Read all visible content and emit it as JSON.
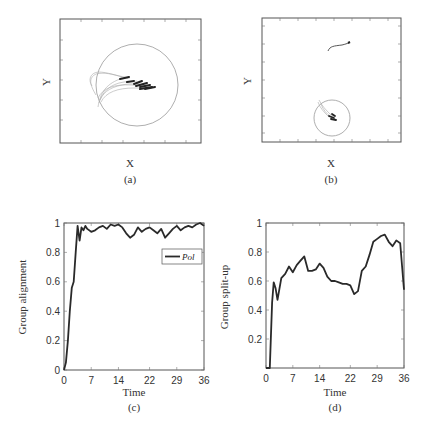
{
  "chart_data": [
    {
      "id": "a",
      "type": "scatter",
      "title": "",
      "caption": "(a)",
      "xlabel": "X",
      "ylabel": "Y",
      "description": "Trajectories of agents converging rightward inside a large circular region",
      "grid": false
    },
    {
      "id": "b",
      "type": "scatter",
      "title": "",
      "caption": "(b)",
      "xlabel": "X",
      "ylabel": "Y",
      "description": "Split group: one short trajectory near top, main group clustered inside a small circle near bottom",
      "grid": false
    },
    {
      "id": "c",
      "type": "line",
      "title": "",
      "caption": "(c)",
      "xlabel": "Time",
      "ylabel": "Group alignment",
      "xticks": [
        "0",
        "7",
        "14",
        "22",
        "29",
        "36"
      ],
      "yticks": [
        "0",
        "0.2",
        "0.4",
        "0.6",
        "0.8",
        "1"
      ],
      "xlim": [
        0,
        36
      ],
      "ylim": [
        0,
        1
      ],
      "legend": {
        "entries": [
          "Pol"
        ],
        "position": "upper right"
      },
      "series": [
        {
          "name": "Pol",
          "x": [
            0,
            0.5,
            1,
            1.5,
            2,
            2.5,
            3,
            3.5,
            4,
            4.5,
            5,
            5.5,
            6,
            7,
            8,
            9,
            10,
            11,
            12,
            13,
            14,
            15,
            16,
            17,
            18,
            19,
            20,
            21,
            22,
            23,
            24,
            25,
            26,
            27,
            28,
            29,
            30,
            31,
            32,
            33,
            34,
            35,
            36
          ],
          "values": [
            0,
            0.05,
            0.2,
            0.4,
            0.56,
            0.6,
            0.8,
            0.98,
            0.88,
            0.97,
            0.95,
            0.98,
            0.96,
            0.94,
            0.95,
            0.97,
            0.98,
            0.96,
            0.99,
            0.98,
            0.99,
            0.97,
            0.93,
            0.9,
            0.92,
            0.97,
            0.94,
            0.96,
            0.97,
            0.95,
            0.93,
            0.96,
            0.9,
            0.93,
            0.96,
            0.98,
            0.95,
            0.97,
            0.98,
            0.97,
            0.99,
            1.0,
            0.98
          ]
        }
      ]
    },
    {
      "id": "d",
      "type": "line",
      "title": "",
      "caption": "(d)",
      "xlabel": "Time",
      "ylabel": "Group split-up",
      "xticks": [
        "0",
        "7",
        "14",
        "22",
        "29",
        "36"
      ],
      "yticks": [
        "0.2",
        "0.4",
        "0.6",
        "0.8",
        "1"
      ],
      "xlim": [
        0,
        36
      ],
      "ylim": [
        0,
        1
      ],
      "series": [
        {
          "name": "split-up",
          "x": [
            0,
            1,
            1.6,
            2,
            2.5,
            3,
            4,
            5,
            6,
            7,
            8,
            9,
            10,
            11,
            12,
            13,
            14,
            15,
            16,
            17,
            18,
            19,
            20,
            21,
            22,
            23,
            24,
            25,
            26,
            27,
            28,
            29,
            30,
            31,
            32,
            33,
            34,
            35,
            35.5,
            36
          ],
          "values": [
            0,
            0,
            0.45,
            0.59,
            0.55,
            0.47,
            0.62,
            0.65,
            0.7,
            0.66,
            0.71,
            0.74,
            0.77,
            0.67,
            0.67,
            0.68,
            0.72,
            0.69,
            0.63,
            0.6,
            0.6,
            0.59,
            0.58,
            0.58,
            0.57,
            0.51,
            0.53,
            0.67,
            0.7,
            0.78,
            0.87,
            0.89,
            0.91,
            0.92,
            0.87,
            0.84,
            0.88,
            0.86,
            0.7,
            0.54
          ]
        }
      ]
    }
  ],
  "panels": {
    "a": {
      "xlabel": "X",
      "ylabel": "Y",
      "caption": "(a)"
    },
    "b": {
      "xlabel": "X",
      "ylabel": "Y",
      "caption": "(b)"
    },
    "c": {
      "xlabel": "Time",
      "ylabel": "Group alignment",
      "caption": "(c)",
      "legend": "Pol",
      "xticks": [
        "0",
        "7",
        "14",
        "22",
        "29",
        "36"
      ],
      "yticks": [
        "0",
        "0.2",
        "0.4",
        "0.6",
        "0.8",
        "1"
      ]
    },
    "d": {
      "xlabel": "Time",
      "ylabel": "Group split-up",
      "caption": "(d)",
      "xticks": [
        "0",
        "7",
        "14",
        "22",
        "29",
        "36"
      ],
      "yticks": [
        "0.2",
        "0.4",
        "0.6",
        "0.8",
        "1"
      ]
    }
  },
  "colors": {
    "line": "#2a2a2a",
    "axis": "#555555",
    "circle": "#999999",
    "trail": "#aaaaaa"
  }
}
